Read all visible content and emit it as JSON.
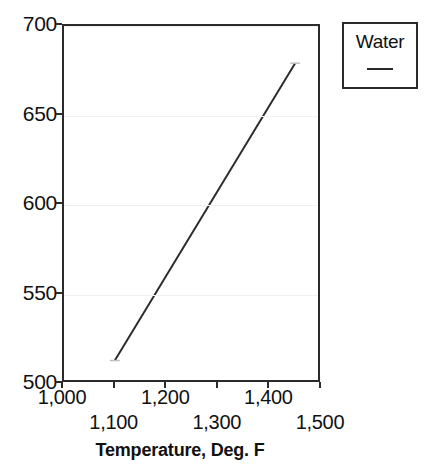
{
  "chart_data": {
    "type": "line",
    "title": "",
    "xlabel": "Temperature, Deg. F",
    "ylabel": "",
    "xlim": [
      1000,
      1500
    ],
    "ylim": [
      500,
      700
    ],
    "grid": true,
    "legend_position": "top-right",
    "x_ticks": [
      {
        "value": 1000,
        "label": "1,000",
        "row": "top"
      },
      {
        "value": 1100,
        "label": "1,100",
        "row": "bottom"
      },
      {
        "value": 1200,
        "label": "1,200",
        "row": "top"
      },
      {
        "value": 1300,
        "label": "1,300",
        "row": "bottom"
      },
      {
        "value": 1400,
        "label": "1,400",
        "row": "top"
      },
      {
        "value": 1500,
        "label": "1,500",
        "row": "bottom"
      }
    ],
    "y_ticks": [
      {
        "value": 500,
        "label": "500"
      },
      {
        "value": 550,
        "label": "550"
      },
      {
        "value": 600,
        "label": "600"
      },
      {
        "value": 650,
        "label": "650"
      },
      {
        "value": 700,
        "label": "700"
      }
    ],
    "series": [
      {
        "name": "Water",
        "color": "#2b2b2b",
        "x": [
          1100,
          1455
        ],
        "values": [
          511,
          679
        ]
      }
    ]
  },
  "legend": {
    "entries": [
      {
        "label": "Water"
      }
    ]
  },
  "axis_titles": {
    "x": "Temperature, Deg. F"
  }
}
